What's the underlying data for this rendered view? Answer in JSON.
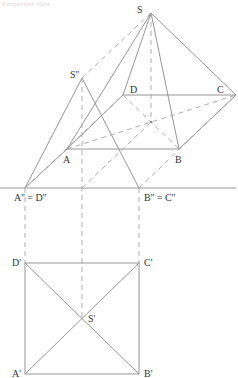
{
  "caption": "Perspective View",
  "colors": {
    "line": "#8a8a8a",
    "dashed": "#a6a6a6",
    "label": "#333333"
  },
  "perspective": {
    "labels": {
      "S": "S",
      "A": "A",
      "B": "B",
      "C": "C",
      "D": "D"
    }
  },
  "elevation": {
    "labels": {
      "S2": "S''",
      "A2D2": "A'' = D''",
      "B2C2": "B'' = C''"
    }
  },
  "plan": {
    "labels": {
      "A1": "A'",
      "B1": "B'",
      "C1": "C'",
      "D1": "D'",
      "S1": "S'"
    }
  }
}
